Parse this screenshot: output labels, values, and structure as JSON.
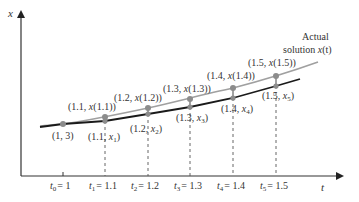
{
  "diagram": {
    "axes": {
      "x_label": "t",
      "y_label": "x"
    },
    "curve_label": {
      "line1": "Actual",
      "line2_prefix": "solution ",
      "line2_func": "x",
      "line2_arg": "(t)"
    },
    "colors": {
      "actual_curve": "#a0a0a0",
      "euler_curve": "#1a1a1a",
      "points": "#8c8c8c",
      "axis": "#333333",
      "dashes": "#555555"
    },
    "ticks": [
      {
        "sym": "t",
        "sub": "0",
        "val": "= 1"
      },
      {
        "sym": "t",
        "sub": "1",
        "val": "= 1.1"
      },
      {
        "sym": "t",
        "sub": "2",
        "val": "= 1.2"
      },
      {
        "sym": "t",
        "sub": "3",
        "val": "= 1.3"
      },
      {
        "sym": "t",
        "sub": "4",
        "val": "= 1.4"
      },
      {
        "sym": "t",
        "sub": "5",
        "val": "= 1.5"
      }
    ],
    "initial_point": {
      "label": "(1, 3)"
    },
    "actual_points": [
      {
        "pre": "(1.1, ",
        "fn": "x",
        "post": "(1.1))"
      },
      {
        "pre": "(1.2, ",
        "fn": "x",
        "post": "(1.2))"
      },
      {
        "pre": "(1.3, ",
        "fn": "x",
        "post": "(1.3))"
      },
      {
        "pre": "(1.4, ",
        "fn": "x",
        "post": "(1.4))"
      },
      {
        "pre": "(1.5, ",
        "fn": "x",
        "post": "(1.5))"
      }
    ],
    "euler_points": [
      {
        "pre": "(1.1, ",
        "fn": "x",
        "sub": "1",
        "post": ")"
      },
      {
        "pre": "(1.2, ",
        "fn": "x",
        "sub": "2",
        "post": ")"
      },
      {
        "pre": "(1.3, ",
        "fn": "x",
        "sub": "3",
        "post": ")"
      },
      {
        "pre": "(1.4, ",
        "fn": "x",
        "sub": "4",
        "post": ")"
      },
      {
        "pre": "(1.5, ",
        "fn": "x",
        "sub": "5",
        "post": ")"
      }
    ]
  }
}
